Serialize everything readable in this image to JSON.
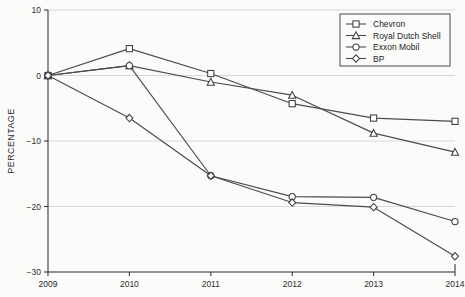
{
  "chart_data": {
    "type": "line",
    "title": "",
    "xlabel": "",
    "ylabel": "PERCENTAGE",
    "categories": [
      "2009",
      "2010",
      "2011",
      "2012",
      "2013",
      "2014"
    ],
    "x": [
      2009,
      2010,
      2011,
      2012,
      2013,
      2014
    ],
    "xlim": [
      2009,
      2014
    ],
    "ylim": [
      -30,
      10
    ],
    "yticks": [
      10,
      0,
      -10,
      -20,
      -30
    ],
    "ytick_labels": [
      "10",
      "0",
      "−10",
      "−20",
      "−30"
    ],
    "xticks": [
      2009,
      2010,
      2011,
      2012,
      2013,
      2014
    ],
    "xtick_labels": [
      "2009",
      "2010",
      "2011",
      "2012",
      "2013",
      "2014"
    ],
    "grid": "horizontal",
    "legend_position": "top-right",
    "series": [
      {
        "name": "Chevron",
        "marker": "square",
        "values": [
          0,
          4.1,
          0.3,
          -4.3,
          -6.5,
          -7.0
        ]
      },
      {
        "name": "Royal Dutch Shell",
        "marker": "triangle",
        "values": [
          0,
          1.5,
          -1.0,
          -3.0,
          -8.8,
          -11.7
        ]
      },
      {
        "name": "Exxon Mobil",
        "marker": "circle",
        "values": [
          0,
          1.5,
          -15.3,
          -18.5,
          -18.6,
          -22.3
        ]
      },
      {
        "name": "BP",
        "marker": "diamond",
        "values": [
          0,
          -6.5,
          -15.3,
          -19.4,
          -20.1,
          -27.6
        ]
      }
    ]
  },
  "legend": {
    "entries": [
      {
        "label": "Chevron"
      },
      {
        "label": "Royal Dutch Shell"
      },
      {
        "label": "Exxon Mobil"
      },
      {
        "label": "BP"
      }
    ]
  },
  "colors": {
    "background": "#fbfbfa",
    "line": "#4a4a52",
    "axis": "#3a3a3a",
    "grid": "#c9c9c9",
    "marker_fill": "#ffffff",
    "text": "#1d1d1d"
  }
}
